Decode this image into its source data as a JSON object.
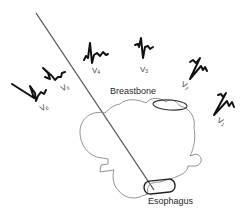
{
  "diagram": {
    "colors": {
      "waveform": "#111111",
      "outline": "#777777",
      "axis_line": "#555555",
      "label": "#333333"
    },
    "leads": [
      {
        "id": "V1",
        "prefix": "V",
        "sub": "1"
      },
      {
        "id": "V2",
        "prefix": "V",
        "sub": "2"
      },
      {
        "id": "V3",
        "prefix": "V",
        "sub": "3"
      },
      {
        "id": "V4",
        "prefix": "V",
        "sub": "4"
      },
      {
        "id": "V5",
        "prefix": "V",
        "sub": "5"
      },
      {
        "id": "V6",
        "prefix": "V",
        "sub": "6"
      }
    ],
    "anatomy": {
      "breastbone": "Breastbone",
      "esophagus": "Esophagus",
      "heart": "heart-cross-section"
    }
  }
}
